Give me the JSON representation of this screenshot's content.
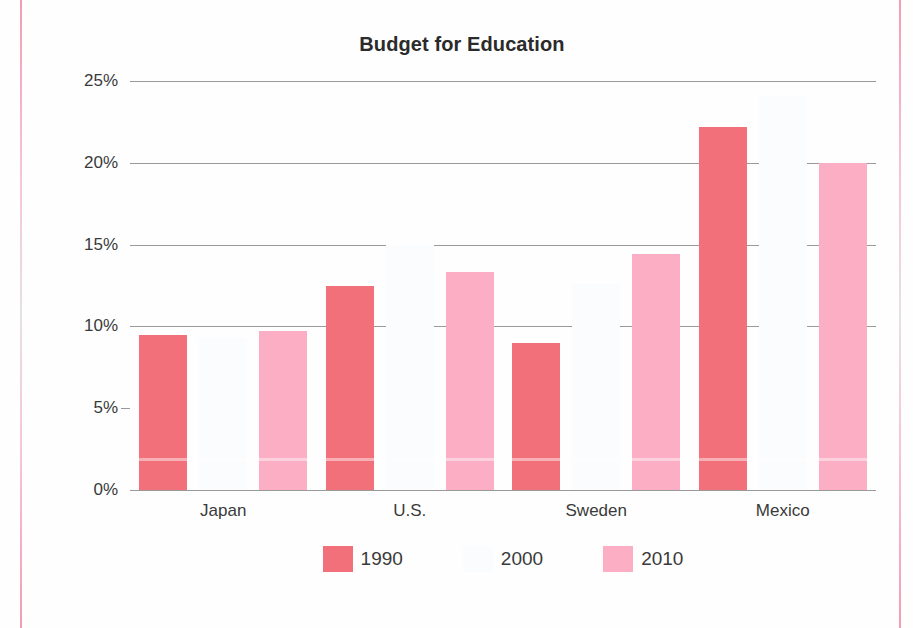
{
  "page": {
    "decor": {
      "left_rule_color": "#f496af",
      "right_rule_color": "#f496af"
    }
  },
  "chart_data": {
    "type": "bar",
    "title": "Budget for Education",
    "xlabel": "",
    "ylabel": "",
    "categories": [
      "Japan",
      "U.S.",
      "Sweden",
      "Mexico"
    ],
    "series": [
      {
        "name": "1990",
        "color": "#f2707a",
        "values": [
          9.5,
          12.5,
          9.0,
          22.2
        ]
      },
      {
        "name": "2000",
        "color": "#fbfcfd",
        "values": [
          9.3,
          15.0,
          12.6,
          24.1
        ]
      },
      {
        "name": "2010",
        "color": "#fbaec4",
        "values": [
          9.7,
          13.3,
          14.4,
          20.0
        ]
      }
    ],
    "ylim": [
      0,
      25
    ],
    "yticks": [
      0,
      5,
      10,
      15,
      20,
      25
    ],
    "ytick_labels": [
      "0%",
      "5%",
      "10%",
      "15%",
      "20%",
      "25%"
    ],
    "gridlines_at": [
      10,
      15,
      20,
      25
    ],
    "grid": true,
    "grid_color": "#9a9a9a",
    "legend_position": "bottom",
    "legend": [
      "1990",
      "2000",
      "2010"
    ]
  }
}
